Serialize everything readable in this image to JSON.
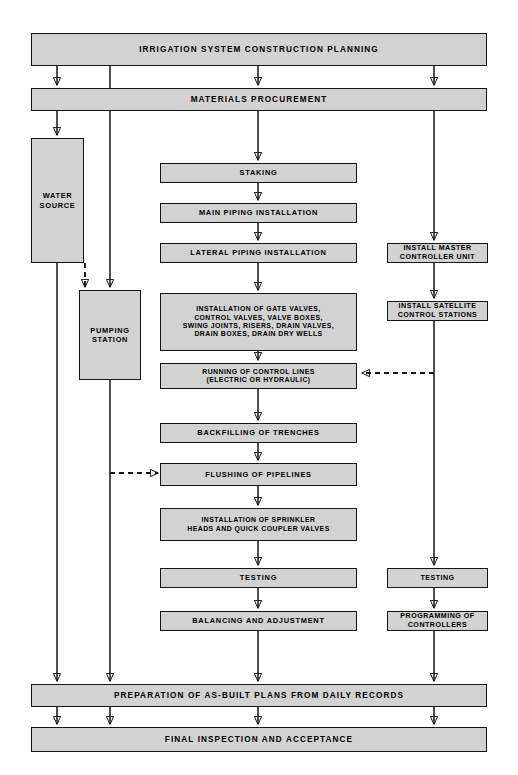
{
  "diagram": {
    "colors": {
      "node_fill": "#d2d2d2",
      "node_stroke": "#141414",
      "background": "#ffffff",
      "text": "#000000"
    }
  },
  "nodes": {
    "planning": {
      "label": "IRRIGATION SYSTEM CONSTRUCTION PLANNING"
    },
    "materials": {
      "label": "MATERIALS PROCUREMENT"
    },
    "water_source": {
      "label": "WATER\nSOURCE"
    },
    "pumping_station": {
      "label": "PUMPING\nSTATION"
    },
    "staking": {
      "label": "STAKING"
    },
    "main_piping": {
      "label": "MAIN PIPING INSTALLATION"
    },
    "lateral_piping": {
      "label": "LATERAL PIPING INSTALLATION"
    },
    "valves": {
      "label": "INSTALLATION OF GATE VALVES,\nCONTROL VALVES, VALVE BOXES,\nSWING JOINTS, RISERS, DRAIN VALVES,\nDRAIN BOXES, DRAIN DRY WELLS"
    },
    "control_lines": {
      "label": "RUNNING OF CONTROL LINES\n(ELECTRIC OR HYDRAULIC)"
    },
    "backfilling": {
      "label": "BACKFILLING OF TRENCHES"
    },
    "flushing": {
      "label": "FLUSHING OF PIPELINES"
    },
    "sprinkler_heads": {
      "label": "INSTALLATION OF SPRINKLER\nHEADS AND QUICK COUPLER VALVES"
    },
    "testing_mid": {
      "label": "TESTING"
    },
    "balancing": {
      "label": "BALANCING AND ADJUSTMENT"
    },
    "master_controller": {
      "label": "INSTALL MASTER\nCONTROLLER UNIT"
    },
    "satellite_stations": {
      "label": "INSTALL SATELLITE\nCONTROL STATIONS"
    },
    "testing_right": {
      "label": "TESTING"
    },
    "programming": {
      "label": "PROGRAMMING OF\nCONTROLLERS"
    },
    "as_built": {
      "label": "PREPARATION OF AS-BUILT PLANS FROM DAILY RECORDS"
    },
    "final_inspection": {
      "label": "FINAL INSPECTION AND ACCEPTANCE"
    }
  }
}
